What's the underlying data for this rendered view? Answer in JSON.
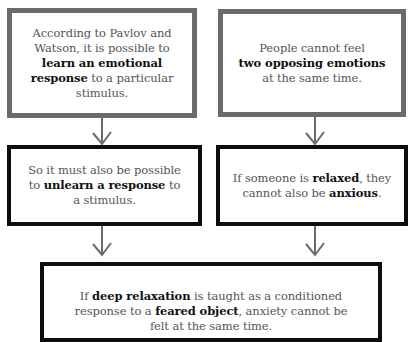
{
  "boxes": {
    "top_left": {
      "lines": [
        {
          "parts": [
            {
              "t": "According to Pavlov and",
              "b": false
            }
          ]
        },
        {
          "parts": [
            {
              "t": "Watson, it is possible to",
              "b": false
            }
          ]
        },
        {
          "parts": [
            {
              "t": "learn an emotional",
              "b": true
            }
          ]
        },
        {
          "parts": [
            {
              "t": "response",
              "b": true
            },
            {
              "t": " to a particular",
              "b": false
            }
          ]
        },
        {
          "parts": [
            {
              "t": "stimulus.",
              "b": false
            }
          ]
        }
      ]
    },
    "top_right": {
      "lines": [
        {
          "parts": [
            {
              "t": "People cannot feel",
              "b": false
            }
          ]
        },
        {
          "parts": [
            {
              "t": "two opposing emotions",
              "b": true
            }
          ]
        },
        {
          "parts": [
            {
              "t": "at the same time.",
              "b": false
            }
          ]
        }
      ]
    },
    "mid_left": {
      "lines": [
        {
          "parts": [
            {
              "t": "So it must also be possible",
              "b": false
            }
          ]
        },
        {
          "parts": [
            {
              "t": "to ",
              "b": false
            },
            {
              "t": "unlearn a response",
              "b": true
            },
            {
              "t": " to",
              "b": false
            }
          ]
        },
        {
          "parts": [
            {
              "t": "a stimulus.",
              "b": false
            }
          ]
        }
      ]
    },
    "mid_right": {
      "lines": [
        {
          "parts": [
            {
              "t": "If someone is ",
              "b": false
            },
            {
              "t": "relaxed",
              "b": true
            },
            {
              "t": ", they",
              "b": false
            }
          ]
        },
        {
          "parts": [
            {
              "t": "cannot also be ",
              "b": false
            },
            {
              "t": "anxious",
              "b": true
            },
            {
              "t": ".",
              "b": false
            }
          ]
        }
      ]
    },
    "bottom": {
      "lines": [
        {
          "parts": [
            {
              "t": "If ",
              "b": false
            },
            {
              "t": "deep relaxation",
              "b": true
            },
            {
              "t": " is taught as a conditioned",
              "b": false
            }
          ]
        },
        {
          "parts": [
            {
              "t": "response to a ",
              "b": false
            },
            {
              "t": "feared object",
              "b": true
            },
            {
              "t": ", anxiety cannot be",
              "b": false
            }
          ]
        },
        {
          "parts": [
            {
              "t": "felt at the same time.",
              "b": false
            }
          ]
        }
      ]
    }
  },
  "colors": {
    "grey_border": "#6b6b6b",
    "black_border": "#0d0d0d",
    "text": "#555555",
    "bold_text": "#111111",
    "arrow": "#6b6b6b"
  }
}
